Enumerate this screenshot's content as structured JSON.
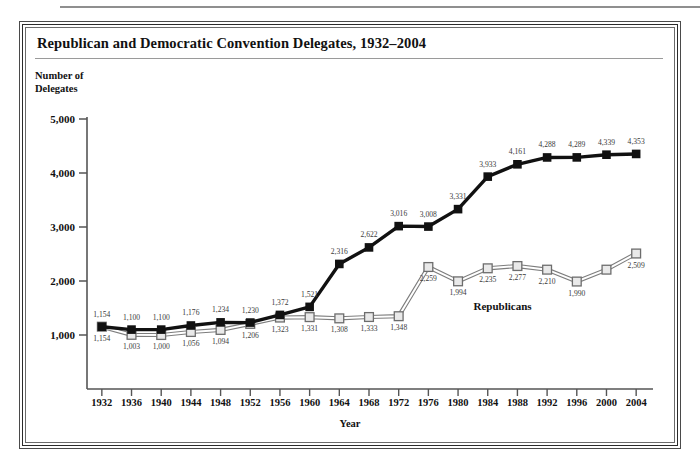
{
  "chart_data": {
    "type": "line",
    "title": "Republican and Democratic Convention Delegates, 1932–2004",
    "xlabel": "Year",
    "ylabel": "Number of\nDelegates",
    "ylabel_line1": "Number of",
    "ylabel_line2": "Delegates",
    "ylim": [
      0,
      5000
    ],
    "yticks": [
      1000,
      2000,
      3000,
      4000,
      5000
    ],
    "ytick_labels": [
      "1,000",
      "2,000",
      "3,000",
      "4,000",
      "5,000"
    ],
    "grid": false,
    "legend_position": "inline-annotation",
    "categories": [
      1932,
      1936,
      1940,
      1944,
      1948,
      1952,
      1956,
      1960,
      1964,
      1968,
      1972,
      1976,
      1980,
      1984,
      1988,
      1992,
      1996,
      2000,
      2004
    ],
    "xtick_labels": [
      "1932",
      "1936",
      "1940",
      "1944",
      "1948",
      "1952",
      "1956",
      "1960",
      "1964",
      "1968",
      "1972",
      "1976",
      "1980",
      "1984",
      "1988",
      "1992",
      "1996",
      "2000",
      "2004"
    ],
    "series": [
      {
        "name": "Democrats",
        "marker": "filled-square",
        "color": "#111111",
        "values": [
          1154,
          1100,
          1100,
          1176,
          1234,
          1230,
          1372,
          1521,
          2316,
          2622,
          3016,
          3008,
          3331,
          3933,
          4161,
          4288,
          4289,
          4339,
          4353
        ],
        "data_labels": [
          "1,154",
          "1,100",
          "1,100",
          "1,176",
          "1,234",
          "1,230",
          "1,372",
          "1,521",
          "2,316",
          "2,622",
          "3,016",
          "3,008",
          "3,331",
          "3,933",
          "4,161",
          "4,288",
          "4,289",
          "4,339",
          "4,353"
        ]
      },
      {
        "name": "Republicans",
        "marker": "open-square",
        "color": "#8a8a8a",
        "values": [
          1154,
          1003,
          1000,
          1056,
          1094,
          1206,
          1323,
          1331,
          1308,
          1333,
          1348,
          2259,
          1994,
          2235,
          2277,
          2210,
          1990,
          2210,
          2509
        ],
        "data_labels": [
          "1,154",
          "1,003",
          "1,000",
          "1,056",
          "1,094",
          "1,206",
          "1,323",
          "1,331",
          "1,308",
          "1,333",
          "1,348",
          "2,259",
          "1,994",
          "2,235",
          "2,277",
          "2,210",
          "1,990",
          "",
          "2,509"
        ]
      }
    ],
    "annotations": [
      {
        "text": "Republicans",
        "x": 1986,
        "y": 1640
      }
    ]
  }
}
